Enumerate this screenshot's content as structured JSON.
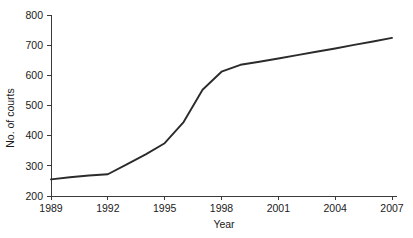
{
  "chart_data": {
    "type": "line",
    "title": "",
    "xlabel": "Year",
    "ylabel": "No. of courts",
    "xlim": [
      1989,
      2007
    ],
    "ylim": [
      200,
      800
    ],
    "grid": false,
    "legend": false,
    "legend_position": "none",
    "line_color": "#2b2b2b",
    "x_tick_labels": [
      "1989",
      "1992",
      "1995",
      "1998",
      "2001",
      "2004",
      "2007"
    ],
    "x_tick_values": [
      1989,
      1992,
      1995,
      1998,
      2001,
      2004,
      2007
    ],
    "y_tick_labels": [
      "200",
      "300",
      "400",
      "500",
      "600",
      "700",
      "800"
    ],
    "y_tick_values": [
      200,
      300,
      400,
      500,
      600,
      700,
      800
    ],
    "x": [
      1989,
      1990,
      1991,
      1992,
      1993,
      1994,
      1995,
      1996,
      1997,
      1998,
      1999,
      2000,
      2001,
      2002,
      2003,
      2004,
      2005,
      2006,
      2007
    ],
    "values": [
      255,
      262,
      268,
      272,
      305,
      338,
      375,
      445,
      552,
      612,
      635,
      645,
      656,
      667,
      678,
      689,
      701,
      712,
      724
    ]
  }
}
